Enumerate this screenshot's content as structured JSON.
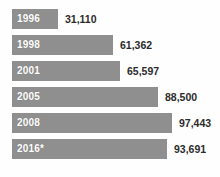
{
  "chart_data": {
    "type": "bar",
    "orientation": "horizontal",
    "title": "",
    "subtitle": "",
    "xlabel": "",
    "ylabel": "",
    "grid": false,
    "legend": null,
    "axis_visible": false,
    "xlim": [
      0,
      110000
    ],
    "categories": [
      "1996",
      "1998",
      "2001",
      "2005",
      "2008",
      "2016*"
    ],
    "values": [
      31110,
      61362,
      65597,
      88500,
      97443,
      93691
    ],
    "value_labels": [
      "31,110",
      "61,362",
      "65,597",
      "88,500",
      "97,443",
      "93,691"
    ],
    "bar_color": "#8f8f8f",
    "label_color": "#ffffff",
    "value_color": "#2b2b2b",
    "background_color": "#fefefe",
    "annotations": [
      "* denotes projected or provisional figure"
    ],
    "bars": [
      {
        "category": "1996",
        "value": 31110,
        "value_label": "31,110",
        "bar_width_px": 46
      },
      {
        "category": "1998",
        "value": 61362,
        "value_label": "61,362",
        "bar_width_px": 101
      },
      {
        "category": "2001",
        "value": 65597,
        "value_label": "65,597",
        "bar_width_px": 108
      },
      {
        "category": "2005",
        "value": 88500,
        "value_label": "88,500",
        "bar_width_px": 146
      },
      {
        "category": "2008",
        "value": 97443,
        "value_label": "97,443",
        "bar_width_px": 160
      },
      {
        "category": "2016*",
        "value": 93691,
        "value_label": "93,691",
        "bar_width_px": 155
      }
    ]
  }
}
